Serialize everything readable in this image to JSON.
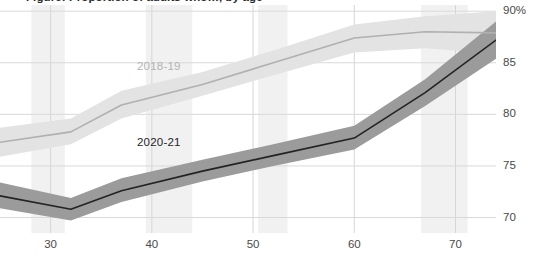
{
  "chart": {
    "title": "Figure: Proportion of adults who…, by age",
    "y_unit_suffix": "%"
  },
  "chart_data": {
    "type": "line",
    "title": "Figure: Proportion of adults who…, by age",
    "xlabel": "Age",
    "ylabel": "Percent",
    "grid": true,
    "legend_position": "inline-annotation",
    "yaxis_side": "right",
    "xlim": [
      25,
      74
    ],
    "ylim": [
      68.5,
      90.6
    ],
    "ytick_values": [
      70,
      75,
      80,
      85,
      90
    ],
    "ytick_labels": [
      "70",
      "75",
      "80",
      "85",
      "90%"
    ],
    "xtick_values": [
      30,
      40,
      50,
      60,
      70
    ],
    "xtick_labels": [
      "30",
      "40",
      "50",
      "60",
      "70"
    ],
    "shaded_x_bands": [
      {
        "from": 28.1,
        "to": 31.4
      },
      {
        "from": 39.4,
        "to": 44.0
      },
      {
        "from": 50.5,
        "to": 53.4
      },
      {
        "from": 66.6,
        "to": 71.2
      }
    ],
    "series": [
      {
        "name": "2018-19",
        "color": "#b0b0b0",
        "band_color": "#e3e3e3",
        "label_color": "#b3b3b3",
        "x": [
          25,
          32,
          37,
          45,
          52,
          60,
          67,
          74
        ],
        "values": [
          77.3,
          78.3,
          80.9,
          82.9,
          85.0,
          87.4,
          88.0,
          87.9
        ],
        "lower": [
          75.9,
          77.1,
          79.6,
          81.8,
          83.8,
          86.0,
          86.4,
          85.9
        ],
        "upper": [
          78.7,
          79.6,
          82.3,
          84.1,
          86.2,
          88.7,
          89.5,
          90.0
        ]
      },
      {
        "name": "2020-21",
        "color": "#232323",
        "band_color": "#9b9b9b",
        "label_color": "#1f1f1f",
        "x": [
          25,
          32,
          37,
          45,
          52,
          60,
          67,
          74
        ],
        "values": [
          72.1,
          70.8,
          72.6,
          74.5,
          76.0,
          77.7,
          82.1,
          87.2
        ],
        "lower": [
          70.9,
          69.7,
          71.5,
          73.5,
          75.0,
          76.6,
          80.8,
          85.4
        ],
        "upper": [
          73.4,
          71.9,
          73.8,
          75.6,
          77.1,
          78.9,
          83.4,
          89.0
        ]
      }
    ]
  },
  "annotations": [
    {
      "text": "2018-19",
      "name": "series-label-2018-19"
    },
    {
      "text": "2020-21",
      "name": "series-label-2020-21"
    }
  ]
}
